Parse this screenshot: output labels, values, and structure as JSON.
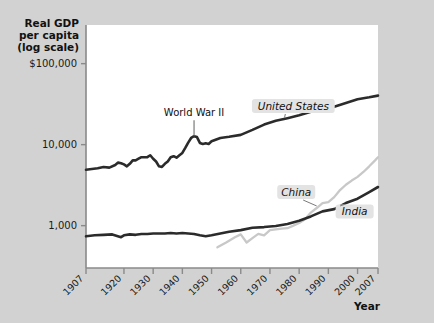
{
  "chart_data": {
    "type": "line",
    "title": "",
    "ylabel": "Real GDP per capita (log scale)",
    "ylabel_lines": [
      "Real GDP",
      "per capita",
      "(log scale)"
    ],
    "xlabel": "Year",
    "y_scale": "log",
    "y_tick_labels": [
      "$100,000",
      "10,000",
      "1,000"
    ],
    "y_tick_values": [
      100000,
      10000,
      1000
    ],
    "ylim": [
      300,
      300000
    ],
    "x_tick_labels": [
      "1907",
      "1920",
      "1930",
      "1940",
      "1950",
      "1960",
      "1970",
      "1980",
      "1990",
      "2000",
      "2007"
    ],
    "x_tick_values": [
      1907,
      1920,
      1930,
      1940,
      1950,
      1960,
      1970,
      1980,
      1990,
      2000,
      2007
    ],
    "xlim": [
      1907,
      2007
    ],
    "grid": false,
    "legend_position": "inline-labels",
    "annotations": [
      {
        "text": "World War II",
        "x": 1944,
        "y": 12000
      }
    ],
    "series": [
      {
        "name": "United States",
        "color": "#2b2b2b",
        "label_x": 1978,
        "label_y": 30000,
        "x": [
          1907,
          1909,
          1911,
          1913,
          1915,
          1917,
          1918,
          1919,
          1920,
          1921,
          1922,
          1923,
          1924,
          1925,
          1926,
          1927,
          1928,
          1929,
          1930,
          1931,
          1932,
          1933,
          1934,
          1935,
          1936,
          1937,
          1938,
          1939,
          1940,
          1941,
          1942,
          1943,
          1944,
          1945,
          1946,
          1947,
          1948,
          1949,
          1950,
          1953,
          1956,
          1960,
          1964,
          1968,
          1972,
          1976,
          1980,
          1984,
          1988,
          1992,
          1996,
          2000,
          2004,
          2007
        ],
        "y": [
          4900,
          5000,
          5100,
          5300,
          5200,
          5600,
          6000,
          5900,
          5700,
          5400,
          5800,
          6400,
          6400,
          6700,
          7000,
          7000,
          7000,
          7400,
          6700,
          6200,
          5400,
          5300,
          5800,
          6200,
          7000,
          7200,
          6900,
          7400,
          7900,
          9100,
          10600,
          12100,
          12700,
          12400,
          10500,
          10200,
          10400,
          10200,
          11000,
          12100,
          12500,
          13200,
          15200,
          17700,
          19700,
          21200,
          23000,
          25500,
          28400,
          29300,
          32600,
          36400,
          38400,
          40300
        ]
      },
      {
        "name": "India",
        "color": "#2b2b2b",
        "label_x": 1999,
        "label_y": 1500,
        "x": [
          1907,
          1910,
          1913,
          1916,
          1919,
          1920,
          1922,
          1924,
          1926,
          1928,
          1930,
          1932,
          1934,
          1936,
          1938,
          1940,
          1942,
          1944,
          1946,
          1948,
          1950,
          1953,
          1956,
          1960,
          1964,
          1968,
          1972,
          1976,
          1980,
          1984,
          1988,
          1992,
          1996,
          2000,
          2004,
          2007
        ],
        "y": [
          740,
          760,
          770,
          780,
          720,
          760,
          780,
          770,
          790,
          790,
          800,
          800,
          800,
          810,
          800,
          810,
          800,
          790,
          760,
          740,
          760,
          800,
          840,
          880,
          940,
          960,
          990,
          1050,
          1150,
          1300,
          1500,
          1600,
          1900,
          2150,
          2600,
          3000
        ]
      },
      {
        "name": "China",
        "color": "#c8c8c8",
        "label_x": 1979,
        "label_y": 2600,
        "x": [
          1952,
          1955,
          1958,
          1960,
          1962,
          1964,
          1966,
          1968,
          1970,
          1972,
          1974,
          1976,
          1978,
          1980,
          1982,
          1984,
          1986,
          1988,
          1990,
          1992,
          1994,
          1996,
          1998,
          2000,
          2002,
          2004,
          2006,
          2007
        ],
        "y": [
          540,
          620,
          720,
          780,
          620,
          700,
          790,
          760,
          880,
          900,
          920,
          930,
          1000,
          1080,
          1200,
          1450,
          1650,
          1900,
          1950,
          2250,
          2750,
          3200,
          3600,
          4000,
          4600,
          5400,
          6400,
          7000
        ]
      }
    ]
  }
}
